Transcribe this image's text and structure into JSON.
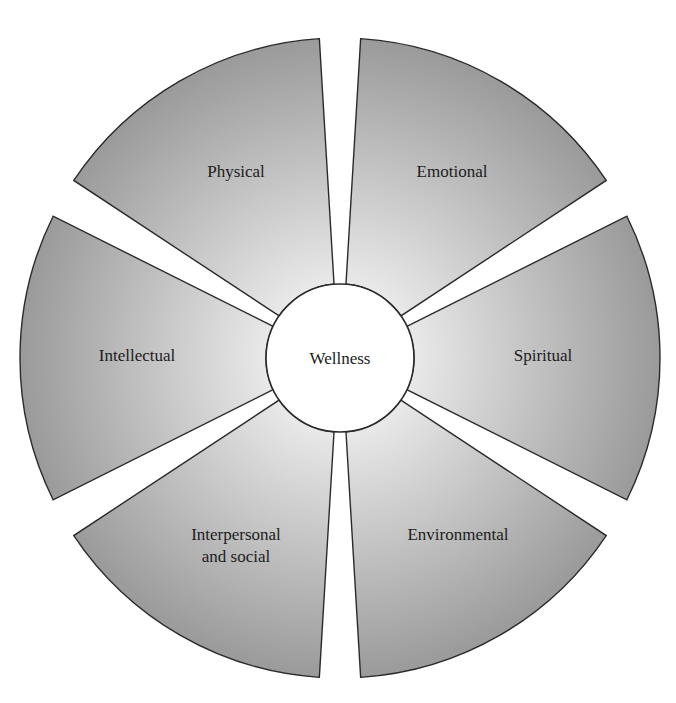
{
  "diagram": {
    "center": {
      "x": 340,
      "y": 358
    },
    "outer_radius": 320,
    "inner_radius": 74,
    "gap_half_angle_deg": 3.7,
    "colors": {
      "fill_inner": "#ececec",
      "fill_outer": "#9a9a9a",
      "stroke": "#2a2a2a",
      "center_fill": "#ffffff"
    },
    "center_label": "Wellness",
    "segments": [
      {
        "name": "physical",
        "label_lines": [
          "Physical"
        ],
        "start_deg": 300,
        "end_deg": 360,
        "label_x": 236,
        "label_y": 177
      },
      {
        "name": "emotional",
        "label_lines": [
          "Emotional"
        ],
        "start_deg": 0,
        "end_deg": 60,
        "label_x": 452,
        "label_y": 177
      },
      {
        "name": "spiritual",
        "label_lines": [
          "Spiritual"
        ],
        "start_deg": 60,
        "end_deg": 120,
        "label_x": 543,
        "label_y": 361
      },
      {
        "name": "environmental",
        "label_lines": [
          "Environmental"
        ],
        "start_deg": 120,
        "end_deg": 180,
        "label_x": 458,
        "label_y": 540
      },
      {
        "name": "interpersonal-and-social",
        "label_lines": [
          "Interpersonal",
          "and social"
        ],
        "start_deg": 180,
        "end_deg": 240,
        "label_x": 236,
        "label_y": 540
      },
      {
        "name": "intellectual",
        "label_lines": [
          "Intellectual"
        ],
        "start_deg": 240,
        "end_deg": 300,
        "label_x": 137,
        "label_y": 361
      }
    ]
  }
}
